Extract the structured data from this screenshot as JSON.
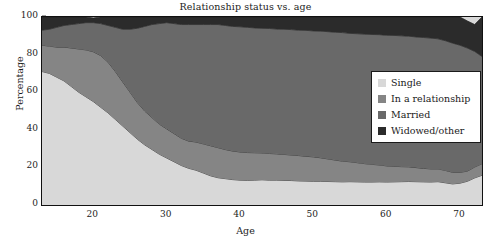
{
  "chart_data": {
    "type": "area",
    "stacked": true,
    "title": "Relationship status vs. age",
    "xlabel": "Age",
    "ylabel": "Percentage",
    "xlim": [
      13,
      73
    ],
    "ylim": [
      0,
      100
    ],
    "grid": false,
    "legend_position": "center-right",
    "xticks": [
      "20",
      "30",
      "40",
      "50",
      "60",
      "70"
    ],
    "xtick_values": [
      20,
      30,
      40,
      50,
      60,
      70
    ],
    "xminor_step": 2,
    "yticks": [
      "0",
      "20",
      "40",
      "60",
      "80",
      "100"
    ],
    "ytick_values": [
      0,
      20,
      40,
      60,
      80,
      100
    ],
    "x": [
      13,
      14,
      15,
      16,
      17,
      18,
      19,
      20,
      21,
      22,
      23,
      24,
      25,
      26,
      27,
      28,
      29,
      30,
      31,
      32,
      33,
      34,
      35,
      36,
      37,
      38,
      39,
      40,
      41,
      42,
      43,
      44,
      45,
      46,
      47,
      48,
      49,
      50,
      51,
      52,
      53,
      54,
      55,
      56,
      57,
      58,
      59,
      60,
      61,
      62,
      63,
      64,
      65,
      66,
      67,
      68,
      69,
      70,
      71,
      72,
      73
    ],
    "series": [
      {
        "name": "Single",
        "color": "#d8d8d8",
        "values": [
          71,
          70,
          68,
          66,
          63,
          60,
          57.5,
          55,
          52,
          49,
          45.5,
          42,
          38.5,
          35,
          32,
          29.5,
          27,
          25,
          23,
          21,
          19.5,
          18.5,
          17,
          15.5,
          14.5,
          14,
          13.5,
          13.2,
          13.1,
          13.2,
          13.4,
          13.2,
          13.2,
          13.1,
          13,
          12.8,
          12.7,
          12.6,
          12.6,
          12.5,
          12.4,
          12.3,
          12.4,
          12.3,
          12.2,
          12.2,
          12.3,
          12.2,
          12.3,
          12.4,
          12.5,
          12.4,
          12.3,
          12.2,
          12.4,
          11.8,
          11.2,
          11.6,
          12.6,
          14.4,
          15.8
        ]
      },
      {
        "name": "In a relationship",
        "color": "#858585",
        "values": [
          14,
          14.5,
          16,
          18,
          20.5,
          23,
          25,
          26.5,
          27.5,
          27,
          25.5,
          23.5,
          21.5,
          19.5,
          18,
          17,
          16,
          15.5,
          15,
          14.5,
          14.5,
          15,
          15.5,
          16,
          16,
          15.5,
          15.2,
          15,
          14.8,
          14.6,
          14.3,
          14.2,
          14,
          13.8,
          13.6,
          13.5,
          13.2,
          13,
          12.5,
          12,
          11.5,
          11,
          10.6,
          10.2,
          9.8,
          9.4,
          9,
          8.6,
          8.3,
          8,
          7.8,
          7.5,
          7.2,
          7,
          6.8,
          6.6,
          6.2,
          5.8,
          5.4,
          5.8,
          6.2
        ]
      },
      {
        "name": "Married",
        "color": "#696969",
        "values": [
          8,
          9,
          10.5,
          11.5,
          12.5,
          13.5,
          14.5,
          15.5,
          17,
          19.5,
          23.5,
          28,
          33.5,
          39.5,
          45,
          49.5,
          53.5,
          56.5,
          58.5,
          60.5,
          62,
          62.5,
          63.5,
          64.5,
          65.5,
          66,
          66.3,
          66.6,
          66.6,
          66.4,
          66.3,
          66.5,
          66.4,
          66.6,
          66.7,
          66.7,
          67,
          67,
          67.4,
          67.7,
          68,
          68.4,
          68.3,
          68.6,
          68.9,
          69.1,
          69.3,
          69.5,
          69.6,
          69.6,
          69.5,
          69.5,
          69.6,
          69.6,
          69.2,
          69,
          68.7,
          67.6,
          65.5,
          61.5,
          57
        ]
      },
      {
        "name": "Widowed/other",
        "color": "#2b2b2b",
        "values": [
          7,
          6.5,
          5.5,
          4.5,
          4,
          3.5,
          3,
          2.5,
          3.5,
          4.5,
          5.5,
          6.5,
          6.5,
          6,
          5,
          4,
          3.5,
          3,
          3.5,
          4,
          4,
          4,
          4,
          4,
          4,
          4.5,
          5,
          5.2,
          5.5,
          5.8,
          6,
          6.1,
          6.4,
          6.5,
          6.7,
          7,
          7.1,
          7.4,
          7.5,
          7.8,
          8.1,
          8.3,
          8.7,
          8.9,
          9.1,
          9.3,
          9.4,
          9.7,
          9.8,
          10,
          10.2,
          10.6,
          10.9,
          11.2,
          11.6,
          12.6,
          13.9,
          15,
          14.4,
          14.3,
          21
        ]
      }
    ]
  },
  "legend": {
    "items": [
      {
        "label": "Single",
        "color": "#d8d8d8"
      },
      {
        "label": "In a relationship",
        "color": "#858585"
      },
      {
        "label": "Married",
        "color": "#696969"
      },
      {
        "label": "Widowed/other",
        "color": "#2b2b2b"
      }
    ]
  }
}
